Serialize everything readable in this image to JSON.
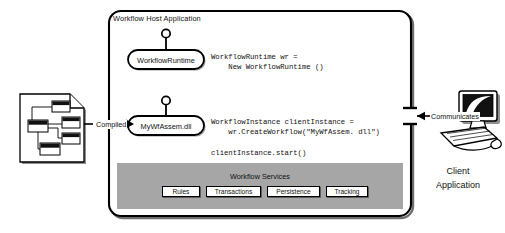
{
  "diagram": {
    "title": "Workflow Host Application",
    "host_box": {
      "label": "Workflow Host Application"
    },
    "nodes": [
      {
        "id": "workflow-runtime",
        "label": "WorkflowRuntime"
      },
      {
        "id": "my-wf-assem-dll",
        "label": "MyWfAssem.dll"
      }
    ],
    "code_blocks": [
      {
        "id": "runtime-code",
        "lines": [
          "WorkflowRuntime wr =",
          "    New WorkflowRuntime ()"
        ],
        "text": "WorkflowRuntime wr =\n    New WorkflowRuntime ()"
      },
      {
        "id": "instance-code",
        "lines": [
          "WorkflowInstance clientInstance =",
          "    wr.CreateWorkflow(\"MyWfAssem. dll\")"
        ],
        "text": "WorkflowInstance clientInstance =\n    wr.CreateWorkflow(\"MyWfAssem. dll\")"
      },
      {
        "id": "start-code",
        "lines": [
          "clientInstance.start()"
        ],
        "text": "clientInstance.start()"
      }
    ],
    "services": {
      "title": "Workflow Services",
      "items": [
        {
          "label": "Rules"
        },
        {
          "label": "Transactions"
        },
        {
          "label": "Persistence"
        },
        {
          "label": "Tracking"
        }
      ]
    },
    "edges": [
      {
        "id": "compiled-edge",
        "label": "Compiled"
      },
      {
        "id": "communicates-edge",
        "label": "Communicates"
      }
    ],
    "left_artifact": {
      "name": "workflow-document",
      "caption": ""
    },
    "right_actor": {
      "name": "client-computer",
      "caption_line1": "Client",
      "caption_line2": "Application"
    },
    "colors": {
      "stroke": "#000000",
      "services_band": "#a6a6a6",
      "node_fill": "#ffffff",
      "page_background": "#ffffff",
      "shadow": "#4a4a4a"
    }
  }
}
